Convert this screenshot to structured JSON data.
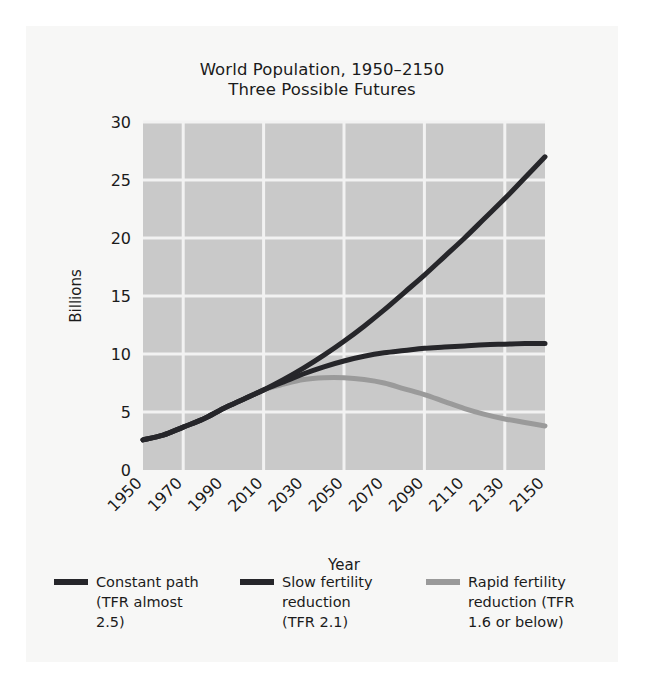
{
  "figure": {
    "title_line1": "World Population, 1950–2150",
    "title_line2": "Three Possible Futures"
  },
  "chart_data": {
    "type": "line",
    "xlabel": "Year",
    "ylabel": "Billions",
    "xlim": [
      1950,
      2150
    ],
    "ylim": [
      0,
      30
    ],
    "grid": true,
    "legend_position": "bottom",
    "xticks": [
      1950,
      1970,
      1990,
      2010,
      2030,
      2050,
      2070,
      2090,
      2110,
      2130,
      2150
    ],
    "xtick_labels": [
      "1950",
      "1970",
      "1990",
      "2010",
      "2030",
      "2050",
      "2070",
      "2090",
      "2110",
      "2130",
      "2150"
    ],
    "yticks": [
      0,
      5,
      10,
      15,
      20,
      25,
      30
    ],
    "ytick_labels": [
      "0",
      "5",
      "10",
      "15",
      "20",
      "25",
      "30"
    ],
    "x": [
      1950,
      1960,
      1970,
      1980,
      1990,
      2000,
      2010,
      2020,
      2030,
      2040,
      2050,
      2060,
      2070,
      2080,
      2090,
      2100,
      2110,
      2120,
      2130,
      2140,
      2150
    ],
    "series": [
      {
        "name": "Constant path (TFR almost 2.5)",
        "color": "#26262a",
        "values": [
          2.6,
          3.0,
          3.7,
          4.4,
          5.3,
          6.1,
          6.9,
          7.8,
          8.8,
          9.9,
          11.1,
          12.4,
          13.8,
          15.3,
          16.8,
          18.4,
          20.0,
          21.7,
          23.4,
          25.2,
          27.0
        ]
      },
      {
        "name": "Slow fertility reduction (TFR 2.1)",
        "color": "#26262a",
        "values": [
          2.6,
          3.0,
          3.7,
          4.4,
          5.3,
          6.1,
          6.9,
          7.6,
          8.3,
          8.9,
          9.4,
          9.8,
          10.1,
          10.3,
          10.5,
          10.6,
          10.7,
          10.8,
          10.85,
          10.9,
          10.9
        ]
      },
      {
        "name": "Rapid fertility reduction (TFR 1.6 or below)",
        "color": "#9a9a9a",
        "values": [
          2.6,
          3.0,
          3.7,
          4.4,
          5.3,
          6.1,
          6.9,
          7.4,
          7.8,
          7.95,
          7.95,
          7.8,
          7.5,
          7.0,
          6.5,
          5.9,
          5.3,
          4.8,
          4.4,
          4.1,
          3.8
        ]
      }
    ]
  },
  "legend": {
    "items": [
      {
        "swatch_color": "#26262a",
        "line1": "Constant path",
        "line2": "(TFR almost",
        "line3": "2.5)"
      },
      {
        "swatch_color": "#26262a",
        "line1": "Slow fertility",
        "line2": "reduction",
        "line3": "(TFR 2.1)"
      },
      {
        "swatch_color": "#9a9a9a",
        "line1": "Rapid fertility",
        "line2": "reduction (TFR",
        "line3": "1.6 or below)"
      }
    ]
  },
  "colors": {
    "plot_background": "#c9c9c9",
    "grid": "#f2f2f2",
    "page_background": "#ffffff",
    "card_background": "#f7f7f6",
    "text": "#1b1b1b"
  }
}
